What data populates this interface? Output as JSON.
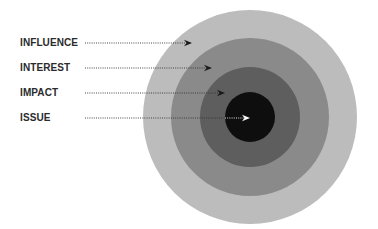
{
  "diagram": {
    "type": "concentric-circles",
    "center": {
      "x": 250,
      "y": 117
    },
    "rings": [
      {
        "name": "influence",
        "label": "INFLUENCE",
        "radius": 107,
        "color": "#bcbcbc",
        "label_y": 43,
        "arrow_tip_x": 192,
        "arrow_color": "#1a1a1a"
      },
      {
        "name": "interest",
        "label": "INTEREST",
        "radius": 79,
        "color": "#8a8a8a",
        "label_y": 68,
        "arrow_tip_x": 212,
        "arrow_color": "#1a1a1a"
      },
      {
        "name": "impact",
        "label": "IMPACT",
        "radius": 50,
        "color": "#5e5e5e",
        "label_y": 93,
        "arrow_tip_x": 225,
        "arrow_color": "#1a1a1a"
      },
      {
        "name": "issue",
        "label": "ISSUE",
        "radius": 25,
        "color": "#0e0e0e",
        "label_y": 118,
        "arrow_tip_x": 250,
        "arrow_color": "#ffffff"
      }
    ],
    "line_start_x": 85,
    "label_color": "#2b2b2b"
  }
}
